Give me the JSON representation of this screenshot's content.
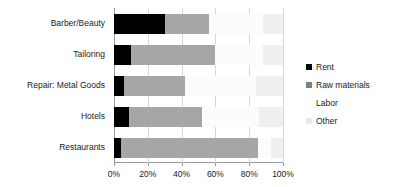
{
  "chart_data": {
    "type": "bar",
    "orientation": "horizontal",
    "stacked": true,
    "normalized": true,
    "title": "",
    "subtitle": "",
    "xlabel": "",
    "ylabel": "",
    "xlim": [
      0,
      100
    ],
    "xticks": [
      0,
      20,
      40,
      60,
      80,
      100
    ],
    "xtick_labels": [
      "0%",
      "20%",
      "40%",
      "60%",
      "80%",
      "100%"
    ],
    "grid": true,
    "grid_axis": "x",
    "legend_position": "right",
    "categories": [
      "Barber/Beauty",
      "Tailoring",
      "Repair: Metal Goods",
      "Hotels",
      "Restaurants"
    ],
    "series": [
      {
        "name": "Rent",
        "color": "#000000",
        "values": [
          30,
          10,
          6,
          9,
          4
        ]
      },
      {
        "name": "Raw materials",
        "color": "#a6a6a6",
        "values": [
          26,
          50,
          36,
          43,
          81
        ]
      },
      {
        "name": "Labor",
        "color": "#fcfcfc",
        "values": [
          32,
          28,
          42,
          34,
          8
        ]
      },
      {
        "name": "Other",
        "color": "#efefef",
        "values": [
          12,
          12,
          16,
          14,
          7
        ]
      }
    ]
  },
  "legend": {
    "items": [
      {
        "label": "Rent",
        "color": "#000000"
      },
      {
        "label": "Raw materials",
        "color": "#808080"
      },
      {
        "label": "Labor",
        "color": "#ffffff"
      },
      {
        "label": "Other",
        "color": "#e8e8e8"
      }
    ]
  }
}
